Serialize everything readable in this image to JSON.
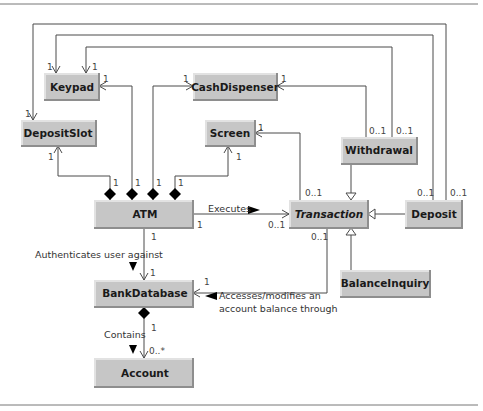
{
  "diagram": {
    "type": "UML class diagram",
    "classes": {
      "keypad": {
        "name": "Keypad"
      },
      "cash_dispenser": {
        "name": "CashDispenser"
      },
      "deposit_slot": {
        "name": "DepositSlot"
      },
      "screen": {
        "name": "Screen"
      },
      "withdrawal": {
        "name": "Withdrawal"
      },
      "atm": {
        "name": "ATM"
      },
      "transaction": {
        "name": "Transaction",
        "abstract": true
      },
      "deposit": {
        "name": "Deposit"
      },
      "bank_database": {
        "name": "BankDatabase"
      },
      "balance_inquiry": {
        "name": "BalanceInquiry"
      },
      "account": {
        "name": "Account"
      }
    },
    "associations": {
      "executes": "Executes",
      "authenticates": "Authenticates user against",
      "accesses_line1": "Accesses/modifies an",
      "accesses_line2": "account balance through",
      "contains": "Contains"
    },
    "multiplicities": {
      "one": "1",
      "zero_or_one": "0..1",
      "zero_or_more": "0..*"
    },
    "colors": {
      "class_fill": "#c6c6c6",
      "line": "#4a4a4a",
      "diamond": "#000000"
    }
  }
}
